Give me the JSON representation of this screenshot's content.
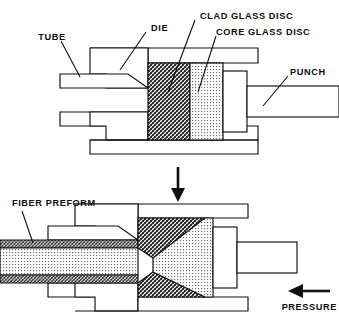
{
  "figure": {
    "background_color": "#ffffff",
    "line_color": "#111111"
  },
  "labels": {
    "tube": "TUBE",
    "die": "DIE",
    "clad_glass_disc": "CLAD GLASS DISC",
    "core_glass_disc": "CORE GLASS DISC",
    "punch": "PUNCH",
    "fiber_preform": "FIBER PREFORM",
    "pressure": "PRESSURE"
  },
  "panels": {
    "upper": {
      "name": "before-extrusion",
      "components": [
        "tube",
        "die",
        "clad glass disc",
        "core glass disc",
        "punch"
      ]
    },
    "lower": {
      "name": "after-extrusion",
      "components": [
        "fiber preform",
        "die",
        "clad glass",
        "core glass",
        "punch",
        "pressure"
      ]
    }
  },
  "arrows": {
    "process_flow": {
      "direction": "down",
      "label": ""
    },
    "pressure": {
      "direction": "left",
      "label": "PRESSURE"
    }
  },
  "materials": {
    "clad_glass": {
      "pattern": "diagonal-crosshatch",
      "tone": "dark",
      "color": "#8a8a8a"
    },
    "core_glass": {
      "pattern": "fine-dot-stipple",
      "tone": "light",
      "color": "#c9c9c9"
    },
    "metal_tooling": {
      "pattern": "solid-outline",
      "tone": "white",
      "color": "#ffffff"
    }
  }
}
